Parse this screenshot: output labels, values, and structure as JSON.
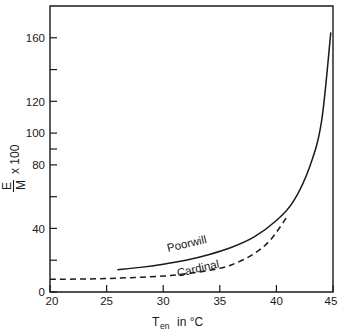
{
  "chart_data": {
    "type": "line",
    "title": "",
    "xlabel": "T_en in °C",
    "ylabel": "E/M x 100",
    "xlim": [
      20,
      45
    ],
    "ylim": [
      0,
      180
    ],
    "grid": false,
    "legend": "inline-curve-labels",
    "x_ticks_labeled": [
      20,
      25,
      30,
      35,
      40,
      45
    ],
    "x_tick_labels": [
      "20",
      "25",
      "30",
      "35",
      "40",
      "45"
    ],
    "y_ticks_labeled": [
      0,
      40,
      80,
      100,
      120,
      160
    ],
    "y_tick_labels": [
      "0",
      "40",
      "80",
      "100",
      "120",
      "160"
    ],
    "y_ticks_unlabeled": [
      20,
      60,
      140,
      180
    ],
    "series": [
      {
        "name": "Poorwill",
        "style": "solid",
        "x": [
          26.0,
          28.0,
          30.0,
          32.0,
          34.0,
          36.0,
          38.0,
          40.0,
          41.5,
          43.0,
          44.0,
          44.8
        ],
        "values": [
          14.0,
          15.5,
          17.5,
          20.0,
          23.5,
          28.0,
          34.5,
          45.0,
          57.0,
          80.0,
          108.0,
          163.0
        ]
      },
      {
        "name": "Cardinal",
        "style": "dashed",
        "x": [
          20.0,
          24.0,
          27.0,
          30.0,
          32.0,
          34.0,
          36.0,
          38.0,
          39.5,
          41.0
        ],
        "values": [
          8.0,
          8.3,
          9.0,
          10.0,
          11.5,
          13.5,
          17.0,
          24.0,
          33.0,
          48.0
        ]
      }
    ],
    "annotations": [
      {
        "text": "Poorwill",
        "x": 31.5,
        "y": 26.5
      },
      {
        "text": "Cardinal",
        "x": 33.5,
        "y": 9.0
      }
    ]
  },
  "axis": {
    "y_label_numerator": "E",
    "y_label_denominator": "M",
    "y_label_multiplier": "x 100",
    "x_label_main": "T",
    "x_label_sub": "en",
    "x_label_tail": "in °C"
  },
  "colors": {
    "ink": "#1a1a1a",
    "background": "#ffffff"
  }
}
